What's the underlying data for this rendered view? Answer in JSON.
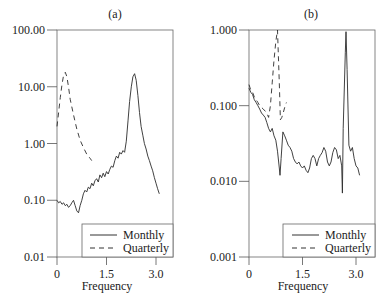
{
  "chart_data": [
    {
      "id": "a",
      "type": "line",
      "title": "(a)",
      "xlabel": "Frequency",
      "ylabel": "",
      "yscale": "log",
      "xlim": [
        0,
        3.5
      ],
      "ylim": [
        0.01,
        100
      ],
      "xticks": [
        0,
        1.5,
        3.0
      ],
      "xtick_labels": [
        "0",
        "1.5",
        "3.0"
      ],
      "yticks": [
        100,
        10,
        1,
        0.1,
        0.01
      ],
      "ytick_labels": [
        "100.00",
        "10.00",
        "1.00",
        "0.10",
        "0.01"
      ],
      "grid": false,
      "legend_position": "lower right",
      "series": [
        {
          "name": "Monthly",
          "style": "solid",
          "x": [
            0.0,
            0.05,
            0.1,
            0.15,
            0.2,
            0.25,
            0.3,
            0.35,
            0.4,
            0.45,
            0.5,
            0.55,
            0.6,
            0.65,
            0.7,
            0.75,
            0.8,
            0.85,
            0.9,
            0.95,
            1.0,
            1.05,
            1.1,
            1.15,
            1.2,
            1.25,
            1.3,
            1.35,
            1.4,
            1.45,
            1.5,
            1.55,
            1.6,
            1.65,
            1.7,
            1.75,
            1.8,
            1.85,
            1.9,
            1.95,
            2.0,
            2.05,
            2.1,
            2.15,
            2.2,
            2.25,
            2.3,
            2.35,
            2.4,
            2.45,
            2.5,
            2.55,
            2.6,
            2.65,
            2.7,
            2.75,
            2.8,
            2.85,
            2.9,
            2.95,
            3.0,
            3.05,
            3.1
          ],
          "values": [
            0.1,
            0.09,
            0.095,
            0.085,
            0.09,
            0.08,
            0.085,
            0.075,
            0.08,
            0.09,
            0.1,
            0.08,
            0.065,
            0.06,
            0.08,
            0.1,
            0.13,
            0.15,
            0.14,
            0.17,
            0.16,
            0.2,
            0.18,
            0.22,
            0.24,
            0.21,
            0.28,
            0.25,
            0.3,
            0.26,
            0.32,
            0.29,
            0.35,
            0.4,
            0.38,
            0.5,
            0.6,
            0.55,
            0.7,
            0.65,
            0.75,
            0.7,
            1.1,
            2.5,
            5.5,
            10,
            15,
            17,
            13,
            7,
            3.5,
            2,
            1.4,
            1.0,
            0.8,
            0.6,
            0.5,
            0.4,
            0.33,
            0.25,
            0.2,
            0.16,
            0.13
          ]
        },
        {
          "name": "Quarterly",
          "style": "dashed",
          "x": [
            0.0,
            0.05,
            0.1,
            0.15,
            0.2,
            0.25,
            0.3,
            0.35,
            0.4,
            0.5,
            0.6,
            0.7,
            0.8,
            0.9,
            1.0,
            1.05
          ],
          "values": [
            2.0,
            3.5,
            6.5,
            11,
            16,
            18,
            15,
            10,
            6,
            3.2,
            1.8,
            1.15,
            0.85,
            0.65,
            0.55,
            0.5
          ]
        }
      ]
    },
    {
      "id": "b",
      "type": "line",
      "title": "(b)",
      "xlabel": "Frequency",
      "ylabel": "",
      "yscale": "log",
      "xlim": [
        0,
        3.5
      ],
      "ylim": [
        0.001,
        1.0
      ],
      "xticks": [
        0,
        1.5,
        3.0
      ],
      "xtick_labels": [
        "0",
        "1.5",
        "3.0"
      ],
      "yticks": [
        1.0,
        0.1,
        0.01,
        0.001
      ],
      "ytick_labels": [
        "1.000",
        "0.100",
        "0.010",
        "0.001"
      ],
      "grid": false,
      "legend_position": "lower right",
      "series": [
        {
          "name": "Monthly",
          "style": "solid",
          "x": [
            0.0,
            0.05,
            0.1,
            0.15,
            0.2,
            0.25,
            0.3,
            0.35,
            0.4,
            0.45,
            0.5,
            0.55,
            0.6,
            0.65,
            0.7,
            0.75,
            0.8,
            0.85,
            0.87,
            0.9,
            0.95,
            1.0,
            1.05,
            1.1,
            1.15,
            1.2,
            1.25,
            1.3,
            1.35,
            1.4,
            1.45,
            1.5,
            1.55,
            1.6,
            1.65,
            1.7,
            1.75,
            1.8,
            1.85,
            1.9,
            1.95,
            2.0,
            2.05,
            2.1,
            2.15,
            2.2,
            2.25,
            2.3,
            2.35,
            2.4,
            2.45,
            2.5,
            2.55,
            2.6,
            2.62,
            2.64,
            2.7,
            2.72,
            2.75,
            2.8,
            2.85,
            2.9,
            2.95,
            3.0,
            3.05,
            3.1
          ],
          "values": [
            0.17,
            0.15,
            0.14,
            0.12,
            0.11,
            0.1,
            0.09,
            0.08,
            0.075,
            0.07,
            0.06,
            0.05,
            0.045,
            0.05,
            0.04,
            0.035,
            0.025,
            0.015,
            0.012,
            0.02,
            0.045,
            0.04,
            0.035,
            0.03,
            0.028,
            0.025,
            0.02,
            0.018,
            0.017,
            0.018,
            0.016,
            0.015,
            0.016,
            0.014,
            0.013,
            0.015,
            0.02,
            0.022,
            0.02,
            0.016,
            0.02,
            0.022,
            0.024,
            0.028,
            0.025,
            0.018,
            0.016,
            0.018,
            0.024,
            0.028,
            0.026,
            0.02,
            0.022,
            0.016,
            0.007,
            0.05,
            0.5,
            0.95,
            0.3,
            0.03,
            0.025,
            0.028,
            0.02,
            0.016,
            0.015,
            0.012
          ]
        },
        {
          "name": "Quarterly",
          "style": "dashed",
          "x": [
            0.0,
            0.05,
            0.1,
            0.15,
            0.2,
            0.25,
            0.3,
            0.35,
            0.4,
            0.45,
            0.5,
            0.55,
            0.6,
            0.65,
            0.7,
            0.75,
            0.8,
            0.85,
            0.88,
            0.92,
            0.96,
            1.0,
            1.05
          ],
          "values": [
            0.19,
            0.16,
            0.15,
            0.13,
            0.12,
            0.11,
            0.1,
            0.095,
            0.09,
            0.085,
            0.08,
            0.07,
            0.1,
            0.2,
            0.4,
            0.7,
            1.0,
            0.2,
            0.065,
            0.07,
            0.08,
            0.095,
            0.11
          ]
        }
      ]
    }
  ],
  "panels": {
    "a": {
      "title": "(a)",
      "xlabel": "Frequency",
      "yticks": [
        "100.00",
        "10.00",
        "1.00",
        "0.10",
        "0.01"
      ],
      "xticks": [
        "0",
        "1.5",
        "3.0"
      ],
      "legend": [
        "Monthly",
        "Quarterly"
      ]
    },
    "b": {
      "title": "(b)",
      "xlabel": "Frequency",
      "yticks": [
        "1.000",
        "0.100",
        "0.010",
        "0.001"
      ],
      "xticks": [
        "0",
        "1.5",
        "3.0"
      ],
      "legend": [
        "Monthly",
        "Quarterly"
      ]
    }
  },
  "colors": {
    "line": "#2b2b2b",
    "axis": "#555555",
    "text": "#222222"
  }
}
